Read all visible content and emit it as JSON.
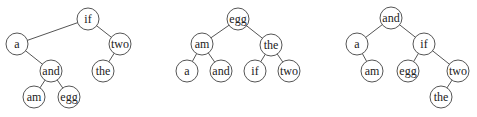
{
  "diagram": {
    "type": "binary-search-trees",
    "node_radius": 11,
    "trees": [
      {
        "id": "tree-1",
        "root": "if",
        "nodes": [
          {
            "id": "if",
            "label": "if",
            "x": 88,
            "y": 19
          },
          {
            "id": "a",
            "label": "a",
            "x": 17,
            "y": 44
          },
          {
            "id": "two",
            "label": "two",
            "x": 120,
            "y": 44
          },
          {
            "id": "and",
            "label": "and",
            "x": 51,
            "y": 71
          },
          {
            "id": "the",
            "label": "the",
            "x": 103,
            "y": 71
          },
          {
            "id": "am",
            "label": "am",
            "x": 34,
            "y": 97
          },
          {
            "id": "egg",
            "label": "egg",
            "x": 69,
            "y": 97
          }
        ],
        "edges": [
          [
            "if",
            "a"
          ],
          [
            "if",
            "two"
          ],
          [
            "a",
            "and"
          ],
          [
            "two",
            "the"
          ],
          [
            "and",
            "am"
          ],
          [
            "and",
            "egg"
          ]
        ]
      },
      {
        "id": "tree-2",
        "root": "egg",
        "nodes": [
          {
            "id": "egg",
            "label": "egg",
            "x": 238,
            "y": 19
          },
          {
            "id": "am",
            "label": "am",
            "x": 202,
            "y": 44
          },
          {
            "id": "the",
            "label": "the",
            "x": 271,
            "y": 45
          },
          {
            "id": "a",
            "label": "a",
            "x": 187,
            "y": 71
          },
          {
            "id": "and",
            "label": "and",
            "x": 221,
            "y": 71
          },
          {
            "id": "if",
            "label": "if",
            "x": 255,
            "y": 71
          },
          {
            "id": "two",
            "label": "two",
            "x": 289,
            "y": 71
          }
        ],
        "edges": [
          [
            "egg",
            "am"
          ],
          [
            "egg",
            "the"
          ],
          [
            "am",
            "a"
          ],
          [
            "am",
            "and"
          ],
          [
            "the",
            "if"
          ],
          [
            "the",
            "two"
          ]
        ]
      },
      {
        "id": "tree-3",
        "root": "and",
        "nodes": [
          {
            "id": "and",
            "label": "and",
            "x": 391,
            "y": 18
          },
          {
            "id": "a",
            "label": "a",
            "x": 357,
            "y": 44
          },
          {
            "id": "if",
            "label": "if",
            "x": 424,
            "y": 44
          },
          {
            "id": "am",
            "label": "am",
            "x": 372,
            "y": 71
          },
          {
            "id": "egg",
            "label": "egg",
            "x": 408,
            "y": 71
          },
          {
            "id": "two",
            "label": "two",
            "x": 458,
            "y": 71
          },
          {
            "id": "the",
            "label": "the",
            "x": 441,
            "y": 97
          }
        ],
        "edges": [
          [
            "and",
            "a"
          ],
          [
            "and",
            "if"
          ],
          [
            "a",
            "am"
          ],
          [
            "if",
            "egg"
          ],
          [
            "if",
            "two"
          ],
          [
            "two",
            "the"
          ]
        ]
      }
    ]
  }
}
